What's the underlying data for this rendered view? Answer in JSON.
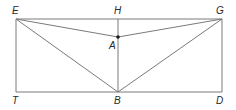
{
  "diagram": {
    "colors": {
      "line": "#7a7a7a",
      "point": "#1a1a1a",
      "label": "#2a2a2a"
    },
    "points": {
      "E": {
        "label": "E",
        "x": 16,
        "y": 19
      },
      "H": {
        "label": "H",
        "x": 118,
        "y": 19
      },
      "G": {
        "label": "G",
        "x": 222,
        "y": 19
      },
      "A": {
        "label": "A",
        "x": 118,
        "y": 37
      },
      "T": {
        "label": "T",
        "x": 16,
        "y": 92
      },
      "B": {
        "label": "B",
        "x": 118,
        "y": 92
      },
      "D": {
        "label": "D",
        "x": 222,
        "y": 92
      }
    },
    "segments": [
      [
        "E",
        "G"
      ],
      [
        "T",
        "D"
      ],
      [
        "E",
        "T"
      ],
      [
        "G",
        "D"
      ],
      [
        "H",
        "B"
      ],
      [
        "E",
        "A"
      ],
      [
        "G",
        "A"
      ],
      [
        "E",
        "B"
      ],
      [
        "G",
        "B"
      ]
    ],
    "labels": {
      "E": "E",
      "H": "H",
      "G": "G",
      "A": "A",
      "T": "T",
      "B": "B",
      "D": "D"
    }
  }
}
